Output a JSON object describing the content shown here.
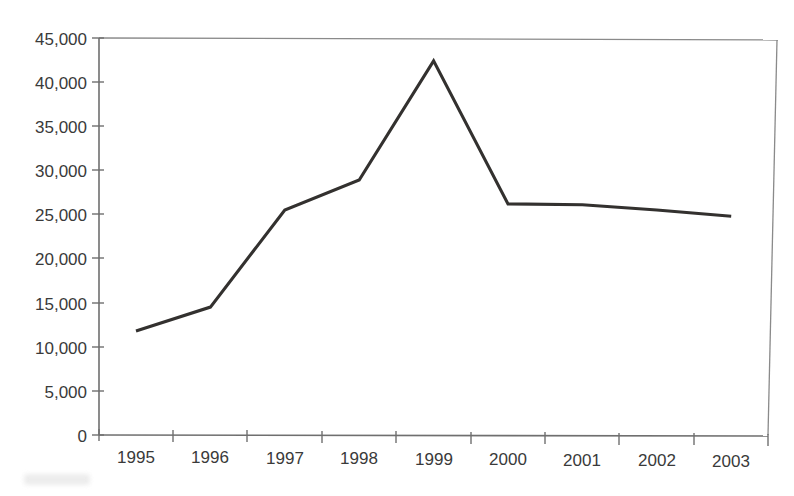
{
  "chart_data": {
    "type": "line",
    "title": "",
    "subtitle": "",
    "xlabel": "",
    "ylabel": "",
    "categories": [
      "1995",
      "1996",
      "1997",
      "1998",
      "1999",
      "2000",
      "2001",
      "2002",
      "2003"
    ],
    "x": [
      1995,
      1996,
      1997,
      1998,
      1999,
      2000,
      2001,
      2002,
      2003
    ],
    "values": [
      11800,
      14500,
      25500,
      28900,
      42400,
      26200,
      26100,
      25500,
      24800
    ],
    "series": [
      {
        "name": "",
        "values": [
          11800,
          14500,
          25500,
          28900,
          42400,
          26200,
          26100,
          25500,
          24800
        ]
      }
    ],
    "ylim": [
      0,
      45000
    ],
    "yticks": [
      0,
      5000,
      10000,
      15000,
      20000,
      25000,
      30000,
      35000,
      40000,
      45000
    ],
    "ytick_labels": [
      "0",
      "5,000",
      "10,000",
      "15,000",
      "20,000",
      "25,000",
      "30,000",
      "35,000",
      "40,000",
      "45,000"
    ],
    "xtick_labels": [
      "1995",
      "1996",
      "1997",
      "1998",
      "1999",
      "2000",
      "2001",
      "2002",
      "2003"
    ],
    "grid": false,
    "legend": false,
    "legend_position": "none",
    "line_color": "#33312f",
    "axis_color": "#6f6f6f",
    "frame_color": "#8a8a8a",
    "background_color": "#ffffff",
    "annotations": []
  },
  "axis": {
    "y_labels": [
      "45,000",
      "40,000",
      "35,000",
      "30,000",
      "25,000",
      "20,000",
      "15,000",
      "10,000",
      "5,000",
      "0"
    ],
    "x_labels": [
      "1995",
      "1996",
      "1997",
      "1998",
      "1999",
      "2000",
      "2001",
      "2002",
      "2003"
    ]
  }
}
